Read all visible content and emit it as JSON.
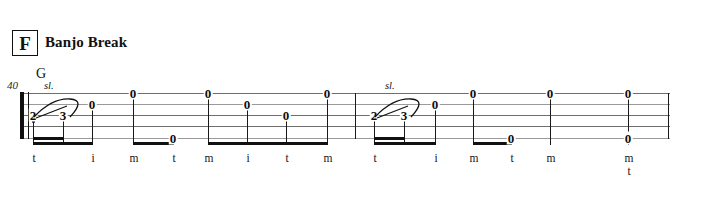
{
  "document": {
    "type": "banjo-tablature",
    "rehearsal_mark": "F",
    "section_title": "Banjo Break",
    "measure_number": "40"
  },
  "staff": {
    "string_count": 5,
    "left": 22,
    "right": 670,
    "top": 93,
    "line_spacing": 11.2
  },
  "chords": [
    {
      "label": "G",
      "x": 36,
      "measure": 1
    }
  ],
  "articulations": [
    {
      "label": "sl.",
      "x": 44,
      "y": 80,
      "measure": 1
    },
    {
      "label": "sl.",
      "x": 385,
      "y": 80,
      "measure": 2
    }
  ],
  "barlines": {
    "opening_repeat": true,
    "middle_barline_x": 355,
    "end_barline_x": 668
  },
  "measures": [
    {
      "index": 1,
      "notes": [
        {
          "fret": "2",
          "string": 3,
          "x": 33,
          "finger": "t",
          "slide_to": "3"
        },
        {
          "fret": "3",
          "string": 3,
          "x": 63,
          "finger": "",
          "slide_target": true
        },
        {
          "fret": "0",
          "string": 2,
          "x": 92,
          "finger": "i"
        },
        {
          "fret": "0",
          "string": 1,
          "x": 133,
          "finger": "m"
        },
        {
          "fret": "0",
          "string": 5,
          "x": 173,
          "finger": "t"
        },
        {
          "fret": "0",
          "string": 1,
          "x": 208,
          "finger": "m"
        },
        {
          "fret": "0",
          "string": 2,
          "x": 247,
          "finger": "i"
        },
        {
          "fret": "0",
          "string": 3,
          "x": 286,
          "finger": "t"
        },
        {
          "fret": "0",
          "string": 1,
          "x": 327,
          "finger": "m"
        }
      ]
    },
    {
      "index": 2,
      "notes": [
        {
          "fret": "2",
          "string": 3,
          "x": 374,
          "finger": "t",
          "slide_to": "3"
        },
        {
          "fret": "3",
          "string": 3,
          "x": 404,
          "finger": "",
          "slide_target": true
        },
        {
          "fret": "0",
          "string": 2,
          "x": 435,
          "finger": "i"
        },
        {
          "fret": "0",
          "string": 1,
          "x": 473,
          "finger": "m"
        },
        {
          "fret": "0",
          "string": 5,
          "x": 511,
          "finger": "t"
        },
        {
          "fret": "0",
          "string": 1,
          "x": 550,
          "finger": "m"
        },
        {
          "fret": "0",
          "string": 1,
          "x": 628,
          "finger": "m"
        },
        {
          "fret": "0",
          "string": 5,
          "x": 628,
          "finger": "t"
        }
      ]
    }
  ],
  "fingerings": {
    "row_y": 152,
    "measure1": [
      "t",
      "i",
      "m",
      "t",
      "m",
      "i",
      "t",
      "m"
    ],
    "measure2": [
      "t",
      "i",
      "m",
      "t",
      "m",
      "m",
      "t"
    ]
  },
  "beam_groups": [
    {
      "measure": 1,
      "from_x": 33,
      "to_x": 92,
      "beams": 2,
      "partial_second_to_x": 63
    },
    {
      "measure": 1,
      "from_x": 133,
      "to_x": 173,
      "beams": 1
    },
    {
      "measure": 1,
      "from_x": 208,
      "to_x": 327,
      "beams": 1
    },
    {
      "measure": 2,
      "from_x": 374,
      "to_x": 435,
      "beams": 2,
      "partial_second_to_x": 404
    },
    {
      "measure": 2,
      "from_x": 473,
      "to_x": 511,
      "beams": 1
    }
  ]
}
